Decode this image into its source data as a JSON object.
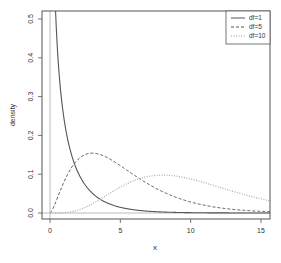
{
  "chart_data": {
    "type": "line",
    "title": "",
    "xlabel": "x",
    "ylabel": "density",
    "xlim": [
      -0.6,
      15.6
    ],
    "ylim": [
      -0.02,
      0.52
    ],
    "x_ticks": [
      "0",
      "5",
      "10",
      "15"
    ],
    "y_ticks": [
      "0.0",
      "0.1",
      "0.2",
      "0.3",
      "0.4",
      "0.5"
    ],
    "grid": false,
    "reference_lines": {
      "vertical_x": 0,
      "horizontal_y": 0
    },
    "legend": {
      "position": "topright",
      "entries": [
        "df=1",
        "df=5",
        "df=10"
      ]
    },
    "series": [
      {
        "name": "df=1",
        "style": "solid",
        "description": "chi-squared density, df=1",
        "x": [
          0.2,
          0.5,
          1,
          1.5,
          2,
          3,
          4,
          5,
          6,
          8,
          10,
          15
        ],
        "y": [
          0.8,
          0.44,
          0.242,
          0.154,
          0.104,
          0.051,
          0.027,
          0.015,
          0.008,
          0.003,
          0.001,
          0.0001
        ]
      },
      {
        "name": "df=5",
        "style": "dashed",
        "description": "chi-squared density, df=5",
        "x": [
          0,
          1,
          2,
          3,
          4,
          5,
          6,
          8,
          10,
          12,
          15
        ],
        "y": [
          0,
          0.081,
          0.138,
          0.154,
          0.144,
          0.122,
          0.096,
          0.052,
          0.028,
          0.013,
          0.004
        ]
      },
      {
        "name": "df=10",
        "style": "dotted",
        "description": "chi-squared density, df=10",
        "x": [
          0,
          2,
          4,
          6,
          8,
          10,
          12,
          14,
          15
        ],
        "y": [
          0,
          0.008,
          0.045,
          0.084,
          0.098,
          0.088,
          0.066,
          0.044,
          0.035
        ]
      }
    ]
  }
}
